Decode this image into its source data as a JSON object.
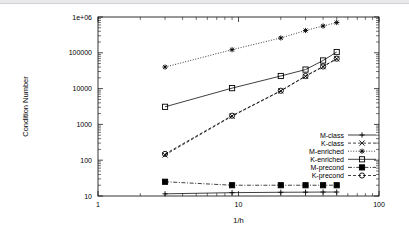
{
  "chart_data": {
    "type": "line",
    "title": "",
    "xlabel": "1/h",
    "ylabel": "Condition Number",
    "xscale": "log",
    "yscale": "log",
    "xlim": [
      1,
      100
    ],
    "ylim": [
      10,
      1000000
    ],
    "grid": false,
    "legend_position": "lower-right-inside",
    "x_tick_labels": [
      "1",
      "10",
      "100"
    ],
    "x_tick_values": [
      1,
      10,
      100
    ],
    "y_tick_labels": [
      "10",
      "100",
      "1000",
      "10000",
      "100000",
      "1e+06"
    ],
    "y_tick_values": [
      10,
      100,
      1000,
      10000,
      100000,
      1000000
    ],
    "x": [
      3,
      9,
      20,
      30,
      40,
      50
    ],
    "series": [
      {
        "name": "M-class",
        "marker": "plus",
        "linestyle": "solid",
        "values": [
          11.5,
          12.4,
          12.7,
          12.8,
          12.9,
          12.9
        ]
      },
      {
        "name": "K-class",
        "marker": "cross",
        "linestyle": "dashed",
        "values": [
          140,
          1700,
          8600,
          22000,
          41000,
          68000
        ]
      },
      {
        "name": "M-enriched",
        "marker": "asterisk",
        "linestyle": "dotted",
        "values": [
          40000,
          122000,
          260000,
          420000,
          560000,
          700000
        ]
      },
      {
        "name": "K-enriched",
        "marker": "square-open",
        "linestyle": "solid",
        "values": [
          3100,
          10300,
          22500,
          34000,
          61000,
          105000
        ]
      },
      {
        "name": "M-precond",
        "marker": "square-filled",
        "linestyle": "dash-dot",
        "values": [
          25,
          20,
          20,
          20,
          20,
          20
        ]
      },
      {
        "name": "K-precond",
        "marker": "circle-open",
        "linestyle": "dashed",
        "values": [
          150,
          1750,
          8700,
          22500,
          41500,
          68500
        ]
      }
    ]
  },
  "legend": {
    "entries": [
      {
        "label": "M-class"
      },
      {
        "label": "K-class"
      },
      {
        "label": "M-enriched"
      },
      {
        "label": "K-enriched"
      },
      {
        "label": "M-precond"
      },
      {
        "label": "K-precond"
      }
    ]
  },
  "axes": {
    "x_title": "1/h",
    "y_title": "Condition Number"
  }
}
